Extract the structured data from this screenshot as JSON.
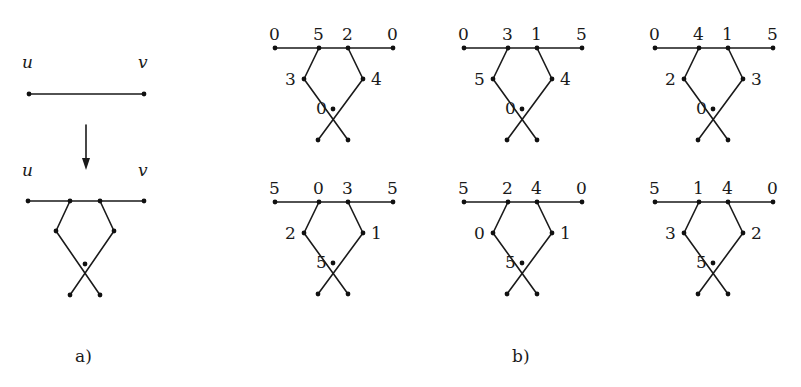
{
  "part_a": {
    "caption": "a)",
    "before": {
      "left_label": "u",
      "right_label": "v"
    },
    "after": {
      "left_label": "u",
      "right_label": "v"
    }
  },
  "part_b": {
    "caption": "b)",
    "graphs": [
      {
        "top": [
          "0",
          "5",
          "2",
          "0"
        ],
        "left": "3",
        "right": "4",
        "center": "0"
      },
      {
        "top": [
          "0",
          "3",
          "1",
          "5"
        ],
        "left": "5",
        "right": "4",
        "center": "0"
      },
      {
        "top": [
          "0",
          "4",
          "1",
          "5"
        ],
        "left": "2",
        "right": "3",
        "center": "0"
      },
      {
        "top": [
          "5",
          "0",
          "3",
          "5"
        ],
        "left": "2",
        "right": "1",
        "center": "5"
      },
      {
        "top": [
          "5",
          "2",
          "4",
          "0"
        ],
        "left": "0",
        "right": "1",
        "center": "5"
      },
      {
        "top": [
          "5",
          "1",
          "4",
          "0"
        ],
        "left": "3",
        "right": "2",
        "center": "5"
      }
    ]
  }
}
